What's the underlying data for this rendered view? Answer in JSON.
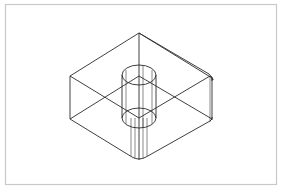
{
  "figure": {
    "colors": {
      "background": "#ffffff",
      "frame": "#c8c8c8",
      "lines": "#2a2a2a"
    },
    "frame": {
      "x": 5,
      "y": 4,
      "width": 271,
      "height": 180
    },
    "block": {
      "top_face": {
        "top": [
          139,
          33
        ],
        "left": [
          70,
          76
        ],
        "front": [
          139,
          118
        ],
        "right": [
          212,
          76
        ]
      },
      "depth": 43
    },
    "cylinder": {
      "center_x": 139,
      "top_center_y": 75,
      "bottom_center_y": 118,
      "rx": 17,
      "ry": 10
    }
  }
}
